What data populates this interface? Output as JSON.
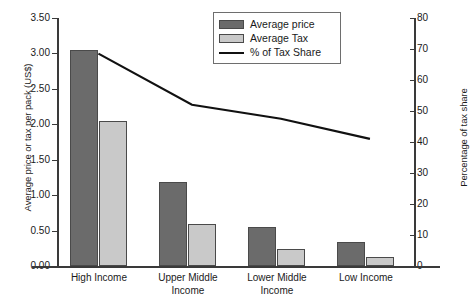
{
  "chart_data": {
    "type": "bar",
    "title": "",
    "categories": [
      "High Income",
      "Upper Middle Income",
      "Lower Middle Income",
      "Low Income"
    ],
    "category_lines": [
      [
        "High Income"
      ],
      [
        "Upper Middle",
        "Income"
      ],
      [
        "Lower Middle",
        "Income"
      ],
      [
        "Low Income"
      ]
    ],
    "series": [
      {
        "name": "Average price",
        "type": "bar",
        "axis": "left",
        "color": "#6b6b6b",
        "values": [
          3.05,
          1.19,
          0.55,
          0.34
        ]
      },
      {
        "name": "Average Tax",
        "type": "bar",
        "axis": "left",
        "color": "#c9c9c9",
        "values": [
          2.05,
          0.6,
          0.24,
          0.13
        ]
      },
      {
        "name": "% of Tax Share",
        "type": "line",
        "axis": "right",
        "color": "#111111",
        "values": [
          68.5,
          52.0,
          47.5,
          41.0
        ]
      }
    ],
    "xlabel": "",
    "ylabel": "Average price or tax per pack (US$)",
    "y2label": "Percentage of tax share",
    "ylim": [
      0.0,
      3.5
    ],
    "y2lim": [
      0,
      80
    ],
    "yticks": [
      "0.00",
      "0.50",
      "1.00",
      "1.50",
      "2.00",
      "2.50",
      "3.00",
      "3.50"
    ],
    "ytick_values": [
      0.0,
      0.5,
      1.0,
      1.5,
      2.0,
      2.5,
      3.0,
      3.5
    ],
    "y2ticks": [
      "0",
      "10",
      "20",
      "30",
      "40",
      "50",
      "60",
      "70",
      "80"
    ],
    "y2tick_values": [
      0,
      10,
      20,
      30,
      40,
      50,
      60,
      70,
      80
    ],
    "grid": false,
    "legend_position": "top-center-right",
    "legend": [
      "Average price",
      "Average Tax",
      "% of Tax Share"
    ]
  },
  "axes": {
    "left_title": "Average price or tax per pack (US$)",
    "right_title": "Percentage of tax share"
  },
  "legend": {
    "items": [
      {
        "label": "Average price",
        "swatch": "price-swatch"
      },
      {
        "label": "Average Tax",
        "swatch": "tax-swatch"
      },
      {
        "label": "% of Tax Share",
        "swatch": "line-swatch"
      }
    ]
  }
}
